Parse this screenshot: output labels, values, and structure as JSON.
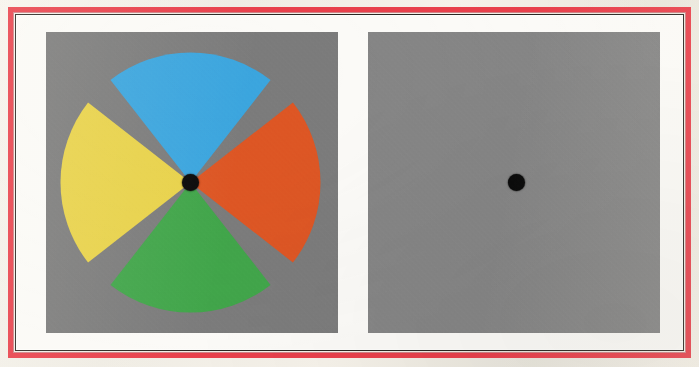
{
  "figure": {
    "kind": "two-panel-visual-stimulus",
    "panel_count": 2,
    "frame_color": "#e8404b",
    "mat_color": "#fbfaf7",
    "rule_color": "#2b2722"
  },
  "left_panel": {
    "name": "color-wheel-stimulus-panel",
    "background_color": "#7b7b7b",
    "fixation_dot": {
      "color": "#0a0a0a",
      "diameter_px": 17,
      "center_x_px": 190,
      "center_y_px": 182
    },
    "wheel": {
      "radius_px": 130,
      "gap_degrees": 14,
      "sectors": [
        {
          "label": "top-sector",
          "color": "#3ba5de",
          "color_name": "blue",
          "start_deg": 200,
          "end_deg": 340
        },
        {
          "label": "right-sector",
          "color": "#dd5624",
          "color_name": "orange",
          "start_deg": 290,
          "end_deg": 430
        },
        {
          "label": "bottom-sector",
          "color": "#41a54a",
          "color_name": "green",
          "start_deg": 20,
          "end_deg": 160
        },
        {
          "label": "left-sector",
          "color": "#e8d24a",
          "color_name": "yellow",
          "start_deg": 110,
          "end_deg": 250
        }
      ]
    }
  },
  "right_panel": {
    "name": "blank-gray-stimulus-panel",
    "background_color": "#858585",
    "fixation_dot": {
      "color": "#0a0a0a",
      "diameter_px": 17,
      "center_x_px": 517,
      "center_y_px": 182
    }
  },
  "chart_data": {
    "type": "pie",
    "title": "",
    "categories": [
      "blue",
      "orange",
      "green",
      "yellow"
    ],
    "values": [
      25,
      25,
      25,
      25
    ],
    "colors": [
      "#3ba5de",
      "#dd5624",
      "#41a54a",
      "#e8d24a"
    ],
    "legend": "none"
  }
}
